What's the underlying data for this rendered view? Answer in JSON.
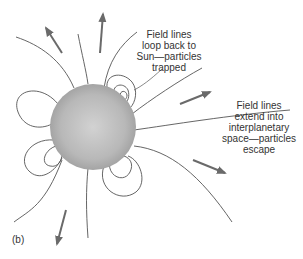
{
  "diagram": {
    "panel_label": "(b)",
    "annotations": {
      "trapped": [
        "Field lines",
        "loop back to",
        "Sun—particles",
        "trapped"
      ],
      "escape": [
        "Field lines",
        "extend into",
        "interplanetary",
        "space—particles",
        "escape"
      ]
    },
    "colors": {
      "sun_center": "#d0d0d0",
      "sun_edge": "#a8a8a8",
      "field_line": "#555555",
      "arrow": "#6a6a6a",
      "text": "#333333"
    }
  }
}
